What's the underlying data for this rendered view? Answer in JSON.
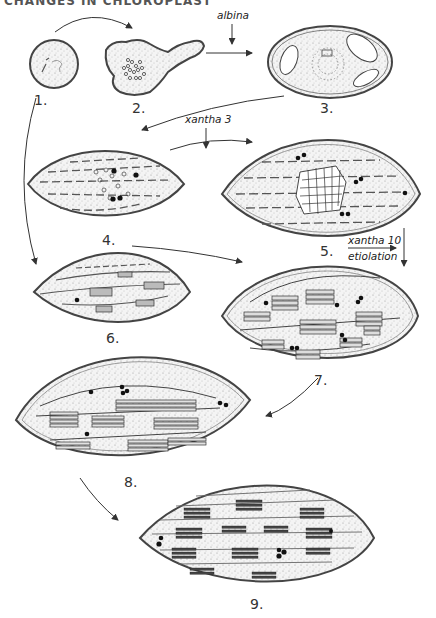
{
  "header": {
    "text": "CHANGES IN CHLOROPLAST"
  },
  "stages": [
    {
      "id": 1,
      "label": "1.",
      "description": "proplastid (round, small)"
    },
    {
      "id": 2,
      "label": "2.",
      "description": "amoeboid plastid with prolamellar granules"
    },
    {
      "id": 3,
      "label": "3.",
      "description": "albina plastid with vesicles and central granular body"
    },
    {
      "id": 4,
      "label": "4.",
      "description": "lens-shaped plastid, single lamellae, central vesicle body"
    },
    {
      "id": 5,
      "label": "5.",
      "description": "plastid with crystalline prolamellar body (lattice)"
    },
    {
      "id": 6,
      "label": "6.",
      "description": "plastid with first grana stacks"
    },
    {
      "id": 7,
      "label": "7.",
      "description": "plastid with developing grana"
    },
    {
      "id": 8,
      "label": "8.",
      "description": "mature-like plastid with grana and stroma lamellae"
    },
    {
      "id": 9,
      "label": "9.",
      "description": "mature chloroplast with grana"
    }
  ],
  "treatments": {
    "albina": "albina",
    "xantha3": "xantha 3",
    "xantha10": "xantha 10",
    "etiolation": "etiolation"
  },
  "colors": {
    "ink": "#2a2a2a",
    "fill": "#efefef",
    "background": "#ffffff"
  }
}
